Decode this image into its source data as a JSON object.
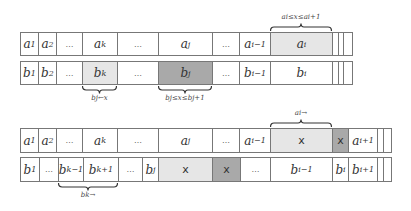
{
  "diagram_top": {
    "row_a": [
      {
        "label": "a1",
        "x": 20,
        "w": 18,
        "style": "normal"
      },
      {
        "label": "a2",
        "x": 38,
        "w": 18,
        "style": "normal"
      },
      {
        "label": "...",
        "x": 56,
        "w": 26,
        "style": "dots"
      },
      {
        "label": "ak",
        "x": 82,
        "w": 35,
        "style": "normal"
      },
      {
        "label": "...",
        "x": 117,
        "w": 41,
        "style": "dots"
      },
      {
        "label": "aj",
        "x": 158,
        "w": 54,
        "style": "normal"
      },
      {
        "label": "...",
        "x": 212,
        "w": 27,
        "style": "dots"
      },
      {
        "label": "ai−1",
        "x": 239,
        "w": 31,
        "style": "normal"
      },
      {
        "label": "ai",
        "x": 270,
        "w": 62,
        "style": "light"
      },
      {
        "label": "",
        "x": 332,
        "w": 6,
        "style": "normal"
      },
      {
        "label": "",
        "x": 338,
        "w": 5,
        "style": "normal"
      },
      {
        "label": "",
        "x": 343,
        "w": 9,
        "style": "normal"
      }
    ],
    "row_b": [
      {
        "label": "b1",
        "x": 20,
        "w": 18,
        "style": "normal"
      },
      {
        "label": "b2",
        "x": 38,
        "w": 18,
        "style": "normal"
      },
      {
        "label": "...",
        "x": 56,
        "w": 26,
        "style": "dots"
      },
      {
        "label": "bk",
        "x": 82,
        "w": 35,
        "style": "light"
      },
      {
        "label": "...",
        "x": 117,
        "w": 41,
        "style": "dots"
      },
      {
        "label": "bj",
        "x": 158,
        "w": 54,
        "style": "dark"
      },
      {
        "label": "...",
        "x": 212,
        "w": 27,
        "style": "dots"
      },
      {
        "label": "bi−1",
        "x": 239,
        "w": 31,
        "style": "normal"
      },
      {
        "label": "bi",
        "x": 270,
        "w": 62,
        "style": "normal"
      },
      {
        "label": "",
        "x": 332,
        "w": 6,
        "style": "normal"
      },
      {
        "label": "",
        "x": 338,
        "w": 5,
        "style": "normal"
      },
      {
        "label": "",
        "x": 343,
        "w": 9,
        "style": "normal"
      }
    ],
    "braces": [
      {
        "label": "ai≤x≤ai+1",
        "x1": 270,
        "x2": 332,
        "pos": "above"
      },
      {
        "label": "bj←x",
        "x1": 82,
        "x2": 117,
        "pos": "below"
      },
      {
        "label": "bj≤x≤bj+1",
        "x1": 158,
        "x2": 212,
        "pos": "below"
      }
    ]
  },
  "diagram_bottom": {
    "row_a": [
      {
        "label": "a1",
        "x": 20,
        "w": 18,
        "style": "normal"
      },
      {
        "label": "a2",
        "x": 38,
        "w": 18,
        "style": "normal"
      },
      {
        "label": "...",
        "x": 56,
        "w": 26,
        "style": "dots"
      },
      {
        "label": "ak",
        "x": 82,
        "w": 35,
        "style": "normal"
      },
      {
        "label": "...",
        "x": 117,
        "w": 41,
        "style": "dots"
      },
      {
        "label": "aj",
        "x": 158,
        "w": 54,
        "style": "normal"
      },
      {
        "label": "...",
        "x": 212,
        "w": 27,
        "style": "dots"
      },
      {
        "label": "ai−1",
        "x": 239,
        "w": 31,
        "style": "normal"
      },
      {
        "label": "x",
        "x": 270,
        "w": 62,
        "style": "light-x"
      },
      {
        "label": "x",
        "x": 332,
        "w": 16,
        "style": "dark-x"
      },
      {
        "label": "ai+1",
        "x": 348,
        "w": 29,
        "style": "normal"
      },
      {
        "label": "",
        "x": 377,
        "w": 6,
        "style": "normal"
      },
      {
        "label": "",
        "x": 383,
        "w": 8,
        "style": "normal"
      }
    ],
    "row_b": [
      {
        "label": "b1",
        "x": 20,
        "w": 19,
        "style": "normal"
      },
      {
        "label": "...",
        "x": 39,
        "w": 19,
        "style": "dots"
      },
      {
        "label": "bk−1",
        "x": 58,
        "w": 25,
        "style": "normal"
      },
      {
        "label": "bk+1",
        "x": 83,
        "w": 35,
        "style": "normal"
      },
      {
        "label": "...",
        "x": 118,
        "w": 24,
        "style": "dots"
      },
      {
        "label": "bj",
        "x": 142,
        "w": 16,
        "style": "normal"
      },
      {
        "label": "x",
        "x": 158,
        "w": 54,
        "style": "light-x"
      },
      {
        "label": "x",
        "x": 212,
        "w": 28,
        "style": "dark-x"
      },
      {
        "label": "...",
        "x": 240,
        "w": 30,
        "style": "dots"
      },
      {
        "label": "bi−1",
        "x": 270,
        "w": 62,
        "style": "normal"
      },
      {
        "label": "bi",
        "x": 332,
        "w": 16,
        "style": "normal"
      },
      {
        "label": "bi+1",
        "x": 348,
        "w": 29,
        "style": "normal"
      },
      {
        "label": "",
        "x": 377,
        "w": 6,
        "style": "normal"
      },
      {
        "label": "",
        "x": 383,
        "w": 8,
        "style": "normal"
      }
    ],
    "braces": [
      {
        "label": "ai→",
        "x1": 270,
        "x2": 332,
        "pos": "above"
      },
      {
        "label": "bk→",
        "x1": 58,
        "x2": 118,
        "pos": "below"
      }
    ]
  }
}
